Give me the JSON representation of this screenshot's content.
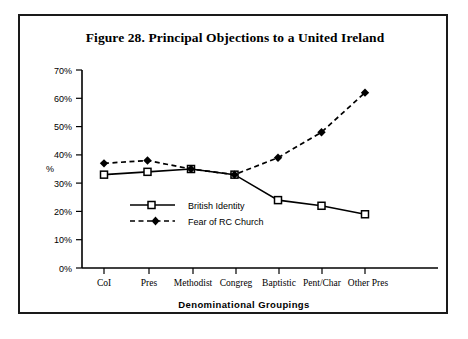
{
  "figure": {
    "title": "Figure 28. Principal Objections to a United Ireland",
    "frame_color": "#1a1a1a"
  },
  "chart_data": {
    "type": "line",
    "title": "Figure 28. Principal Objections to a United Ireland",
    "xlabel": "Denominational  Groupings",
    "ylabel": "%",
    "categories": [
      "CoI",
      "Pres",
      "Methodist",
      "Congreg",
      "Baptistic",
      "Pent/Char",
      "Other Pres"
    ],
    "ylim": [
      0,
      70
    ],
    "ytick_labels": [
      "0%",
      "10%",
      "20%",
      "30%",
      "40%",
      "50%",
      "60%",
      "70%"
    ],
    "ytick_values": [
      0,
      10,
      20,
      30,
      40,
      50,
      60,
      70
    ],
    "grid": false,
    "legend_position": "inside-lower-left",
    "series": [
      {
        "name": "British Identity",
        "values": [
          33,
          34,
          35,
          33,
          24,
          22,
          19
        ],
        "line_style": "solid",
        "marker": "open-square",
        "color": "#000000"
      },
      {
        "name": "Fear of RC Church",
        "values": [
          37,
          38,
          35,
          33,
          39,
          48,
          62
        ],
        "line_style": "dashed",
        "marker": "filled-diamond",
        "color": "#000000"
      }
    ]
  }
}
